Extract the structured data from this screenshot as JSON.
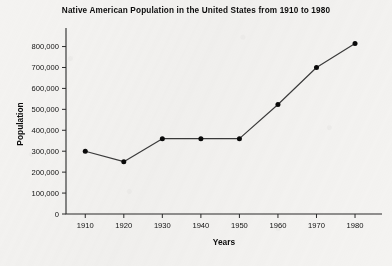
{
  "chart_data": {
    "type": "line",
    "title": "Native American Population in the United States from 1910 to 1980",
    "xlabel": "Years",
    "ylabel": "Population",
    "categories": [
      1910,
      1920,
      1930,
      1940,
      1950,
      1960,
      1970,
      1980
    ],
    "x_tick_labels": [
      "1910",
      "1920",
      "1930",
      "1940",
      "1950",
      "1960",
      "1970",
      "1980"
    ],
    "values": [
      300000,
      250000,
      360000,
      360000,
      360000,
      523000,
      700000,
      815000
    ],
    "y_tick_values": [
      0,
      100000,
      200000,
      300000,
      400000,
      500000,
      600000,
      700000,
      800000
    ],
    "y_tick_labels": [
      "0",
      "100,000",
      "200,000",
      "300,000",
      "400,000",
      "500,000",
      "600,000",
      "700,000",
      "800,000"
    ],
    "xlim": [
      1905,
      1987
    ],
    "ylim": [
      0,
      860000
    ],
    "grid": false,
    "legend": false,
    "marker": "filled-circle",
    "line_color": "#3a3a3a",
    "marker_color": "#0a0a0a",
    "background_color": "#f4f3f1"
  }
}
